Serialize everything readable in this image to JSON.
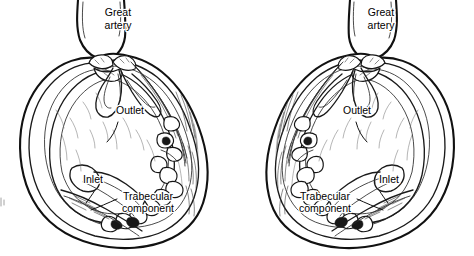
{
  "figure": {
    "name": "ventricular-components-cross-section",
    "background_color": "#ffffff",
    "ink_color": "#111111",
    "width": 474,
    "height": 256
  },
  "panels": [
    {
      "id": "left",
      "name": "left-ventricle-diagram",
      "orientation": "normal",
      "labels": {
        "great_artery": {
          "line1": "Great",
          "line2": "artery",
          "x": 118,
          "y": 16
        },
        "outlet": {
          "text": "Outlet",
          "x": 130,
          "y": 114
        },
        "inlet": {
          "text": "Inlet",
          "x": 93,
          "y": 183
        },
        "trabecular": {
          "line1": "Trabecular",
          "line2": "component",
          "x": 148,
          "y": 200
        }
      }
    },
    {
      "id": "right",
      "name": "right-ventricle-diagram",
      "orientation": "mirrored",
      "labels": {
        "great_artery": {
          "line1": "Great",
          "line2": "artery",
          "x": 381,
          "y": 16
        },
        "outlet": {
          "text": "Outlet",
          "x": 357,
          "y": 114
        },
        "inlet": {
          "text": "Inlet",
          "x": 389,
          "y": 183
        },
        "trabecular": {
          "line1": "Trabecular",
          "line2": "component",
          "x": 325,
          "y": 200
        }
      }
    }
  ],
  "legend_terms": [
    "Great artery",
    "Outlet",
    "Inlet",
    "Trabecular component"
  ]
}
